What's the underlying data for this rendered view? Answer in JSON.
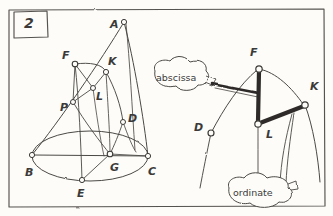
{
  "figure": {
    "panel_number": "2",
    "background_color": "#fdfcf8",
    "ink_color": "#4a4845",
    "thick_ink_color": "#2e2c2a",
    "style": "hand-drawn pencil sketch",
    "frame": {
      "x": 8,
      "y": 9,
      "width": 317,
      "height": 198
    }
  },
  "callouts": [
    {
      "name": "abscissa",
      "text": "abscissa",
      "shape": "cloud",
      "cx": 180,
      "cy": 78
    },
    {
      "name": "ordinate",
      "text": "ordinate",
      "shape": "cloud",
      "cx": 268,
      "cy": 193
    }
  ],
  "left_diagram": {
    "name": "cone-with-elliptical-base",
    "description": "cone with apex A and elliptical base, inscribed conic section through F, K, L, P, D, G, E",
    "points": [
      {
        "label": "A",
        "x": 124,
        "y": 22,
        "label_x": 110,
        "label_y": 19,
        "role": "apex"
      },
      {
        "label": "F",
        "x": 75,
        "y": 64,
        "label_x": 62,
        "label_y": 54,
        "role": "section-point"
      },
      {
        "label": "K",
        "x": 106,
        "y": 72,
        "label_x": 108,
        "label_y": 60,
        "role": "section-point"
      },
      {
        "label": "L",
        "x": 93,
        "y": 88,
        "label_x": 96,
        "label_y": 95,
        "role": "section-point"
      },
      {
        "label": "P",
        "x": 73,
        "y": 102,
        "label_x": 60,
        "label_y": 106,
        "role": "section-point"
      },
      {
        "label": "D",
        "x": 123,
        "y": 122,
        "label_x": 128,
        "label_y": 117,
        "role": "section-point"
      },
      {
        "label": "B",
        "x": 32,
        "y": 155,
        "label_x": 25,
        "label_y": 171,
        "role": "base-left"
      },
      {
        "label": "C",
        "x": 148,
        "y": 156,
        "label_x": 148,
        "label_y": 170,
        "role": "base-right"
      },
      {
        "label": "E",
        "x": 82,
        "y": 180,
        "label_x": 77,
        "label_y": 192,
        "role": "base-front"
      },
      {
        "label": "G",
        "x": 110,
        "y": 154,
        "label_x": 110,
        "label_y": 166,
        "role": "base-center"
      }
    ]
  },
  "right_diagram": {
    "name": "cone-detail-abscissa-ordinate",
    "description": "enlarged detail showing the abscissa segment F-L and ordinate segment L-K",
    "points": [
      {
        "label": "F",
        "x": 259,
        "y": 69,
        "label_x": 250,
        "label_y": 55,
        "role": "top-point"
      },
      {
        "label": "K",
        "x": 305,
        "y": 105,
        "label_x": 310,
        "label_y": 89,
        "role": "right-point"
      },
      {
        "label": "L",
        "x": 258,
        "y": 124,
        "label_x": 266,
        "label_y": 133,
        "role": "junction"
      },
      {
        "label": "D",
        "x": 211,
        "y": 133,
        "label_x": 196,
        "label_y": 127,
        "role": "left-point"
      }
    ],
    "emphasized_segments": [
      {
        "name": "abscissa-segment",
        "from": "F",
        "to": "L"
      },
      {
        "name": "ordinate-segment",
        "from": "L",
        "to": "K"
      }
    ]
  }
}
